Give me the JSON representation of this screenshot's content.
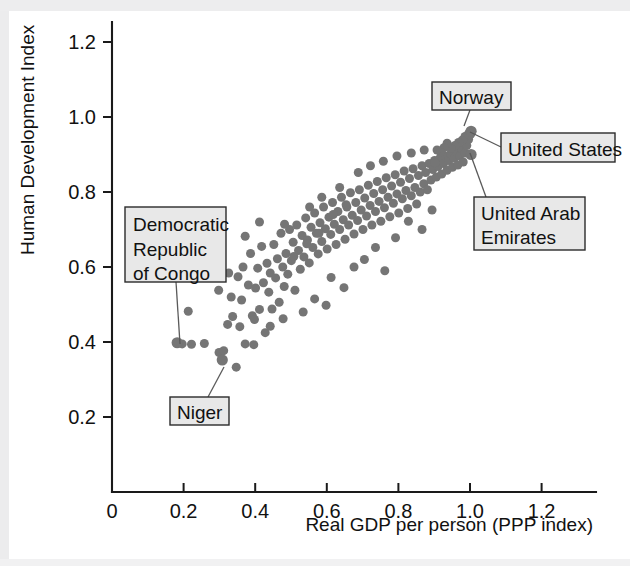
{
  "chart_data": {
    "type": "scatter",
    "title": "",
    "xlabel": "Real GDP per person (PPP index)",
    "ylabel": "Human Development Index",
    "xlim": [
      0,
      1.32
    ],
    "ylim": [
      0,
      1.3
    ],
    "grid": false,
    "legend": "none",
    "xticks": [
      "0",
      "0.2",
      "0.4",
      "0.6",
      "0.8",
      "1.0",
      "1.2"
    ],
    "xtick_values": [
      0,
      0.2,
      0.4,
      0.6,
      0.8,
      1.0,
      1.2
    ],
    "yticks": [
      "0.2",
      "0.4",
      "0.6",
      "0.8",
      "1.0",
      "1.2"
    ],
    "ytick_values": [
      0.2,
      0.4,
      0.6,
      0.8,
      1.0,
      1.2
    ],
    "marker_color": "#757575",
    "marker_size": 9,
    "points": [
      [
        0.182,
        0.398
      ],
      [
        0.196,
        0.395
      ],
      [
        0.213,
        0.482
      ],
      [
        0.222,
        0.394
      ],
      [
        0.258,
        0.396
      ],
      [
        0.299,
        0.372
      ],
      [
        0.308,
        0.352
      ],
      [
        0.312,
        0.377
      ],
      [
        0.323,
        0.447
      ],
      [
        0.333,
        0.52
      ],
      [
        0.337,
        0.468
      ],
      [
        0.347,
        0.333
      ],
      [
        0.352,
        0.574
      ],
      [
        0.357,
        0.441
      ],
      [
        0.362,
        0.512
      ],
      [
        0.366,
        0.6
      ],
      [
        0.372,
        0.395
      ],
      [
        0.381,
        0.552
      ],
      [
        0.387,
        0.636
      ],
      [
        0.392,
        0.47
      ],
      [
        0.396,
        0.393
      ],
      [
        0.401,
        0.544
      ],
      [
        0.407,
        0.597
      ],
      [
        0.412,
        0.487
      ],
      [
        0.418,
        0.655
      ],
      [
        0.423,
        0.558
      ],
      [
        0.428,
        0.425
      ],
      [
        0.433,
        0.61
      ],
      [
        0.438,
        0.533
      ],
      [
        0.442,
        0.584
      ],
      [
        0.447,
        0.488
      ],
      [
        0.452,
        0.66
      ],
      [
        0.457,
        0.571
      ],
      [
        0.462,
        0.622
      ],
      [
        0.467,
        0.506
      ],
      [
        0.472,
        0.69
      ],
      [
        0.477,
        0.6
      ],
      [
        0.481,
        0.548
      ],
      [
        0.486,
        0.636
      ],
      [
        0.491,
        0.581
      ],
      [
        0.496,
        0.7
      ],
      [
        0.501,
        0.617
      ],
      [
        0.506,
        0.666
      ],
      [
        0.511,
        0.538
      ],
      [
        0.516,
        0.712
      ],
      [
        0.521,
        0.644
      ],
      [
        0.526,
        0.594
      ],
      [
        0.531,
        0.684
      ],
      [
        0.536,
        0.627
      ],
      [
        0.541,
        0.731
      ],
      [
        0.546,
        0.672
      ],
      [
        0.551,
        0.611
      ],
      [
        0.556,
        0.706
      ],
      [
        0.561,
        0.652
      ],
      [
        0.566,
        0.744
      ],
      [
        0.571,
        0.69
      ],
      [
        0.576,
        0.635
      ],
      [
        0.581,
        0.718
      ],
      [
        0.586,
        0.668
      ],
      [
        0.591,
        0.76
      ],
      [
        0.596,
        0.702
      ],
      [
        0.601,
        0.648
      ],
      [
        0.606,
        0.733
      ],
      [
        0.611,
        0.687
      ],
      [
        0.616,
        0.772
      ],
      [
        0.621,
        0.714
      ],
      [
        0.626,
        0.66
      ],
      [
        0.631,
        0.748
      ],
      [
        0.636,
        0.7
      ],
      [
        0.641,
        0.786
      ],
      [
        0.646,
        0.726
      ],
      [
        0.651,
        0.674
      ],
      [
        0.656,
        0.76
      ],
      [
        0.661,
        0.712
      ],
      [
        0.666,
        0.798
      ],
      [
        0.671,
        0.738
      ],
      [
        0.676,
        0.688
      ],
      [
        0.681,
        0.772
      ],
      [
        0.686,
        0.724
      ],
      [
        0.691,
        0.806
      ],
      [
        0.696,
        0.752
      ],
      [
        0.701,
        0.7
      ],
      [
        0.706,
        0.784
      ],
      [
        0.711,
        0.736
      ],
      [
        0.716,
        0.818
      ],
      [
        0.721,
        0.764
      ],
      [
        0.726,
        0.712
      ],
      [
        0.731,
        0.796
      ],
      [
        0.736,
        0.748
      ],
      [
        0.741,
        0.828
      ],
      [
        0.746,
        0.775
      ],
      [
        0.751,
        0.722
      ],
      [
        0.756,
        0.806
      ],
      [
        0.761,
        0.758
      ],
      [
        0.766,
        0.838
      ],
      [
        0.771,
        0.786
      ],
      [
        0.776,
        0.734
      ],
      [
        0.781,
        0.816
      ],
      [
        0.786,
        0.77
      ],
      [
        0.791,
        0.846
      ],
      [
        0.796,
        0.795
      ],
      [
        0.801,
        0.744
      ],
      [
        0.806,
        0.826
      ],
      [
        0.811,
        0.782
      ],
      [
        0.816,
        0.856
      ],
      [
        0.821,
        0.804
      ],
      [
        0.826,
        0.756
      ],
      [
        0.831,
        0.836
      ],
      [
        0.836,
        0.79
      ],
      [
        0.841,
        0.862
      ],
      [
        0.846,
        0.812
      ],
      [
        0.851,
        0.768
      ],
      [
        0.856,
        0.844
      ],
      [
        0.861,
        0.8
      ],
      [
        0.866,
        0.87
      ],
      [
        0.871,
        0.822
      ],
      [
        0.876,
        0.852
      ],
      [
        0.881,
        0.806
      ],
      [
        0.886,
        0.876
      ],
      [
        0.891,
        0.832
      ],
      [
        0.896,
        0.86
      ],
      [
        0.901,
        0.884
      ],
      [
        0.906,
        0.84
      ],
      [
        0.911,
        0.868
      ],
      [
        0.916,
        0.89
      ],
      [
        0.921,
        0.848
      ],
      [
        0.926,
        0.876
      ],
      [
        0.931,
        0.896
      ],
      [
        0.936,
        0.858
      ],
      [
        0.941,
        0.884
      ],
      [
        0.946,
        0.902
      ],
      [
        0.951,
        0.866
      ],
      [
        0.956,
        0.89
      ],
      [
        0.961,
        0.908
      ],
      [
        0.966,
        0.872
      ],
      [
        0.971,
        0.896
      ],
      [
        0.976,
        0.916
      ],
      [
        0.981,
        0.88
      ],
      [
        0.986,
        0.904
      ],
      [
        0.991,
        0.924
      ],
      [
        0.996,
        0.94
      ],
      [
        0.999,
        0.955
      ],
      [
        1.003,
        0.962
      ],
      [
        0.986,
        0.948
      ],
      [
        0.978,
        0.938
      ],
      [
        0.968,
        0.932
      ],
      [
        0.958,
        0.924
      ],
      [
        0.947,
        0.916
      ],
      [
        0.936,
        0.93
      ],
      [
        0.927,
        0.918
      ],
      [
        0.918,
        0.906
      ],
      [
        0.908,
        0.912
      ],
      [
        0.612,
        0.572
      ],
      [
        0.648,
        0.545
      ],
      [
        0.676,
        0.6
      ],
      [
        0.705,
        0.62
      ],
      [
        0.736,
        0.652
      ],
      [
        0.762,
        0.59
      ],
      [
        0.792,
        0.678
      ],
      [
        0.828,
        0.722
      ],
      [
        0.866,
        0.7
      ],
      [
        0.894,
        0.752
      ],
      [
        0.566,
        0.515
      ],
      [
        0.534,
        0.48
      ],
      [
        0.598,
        0.498
      ],
      [
        0.478,
        0.462
      ],
      [
        0.442,
        0.442
      ],
      [
        0.398,
        0.46
      ],
      [
        0.508,
        0.628
      ],
      [
        0.552,
        0.76
      ],
      [
        0.586,
        0.786
      ],
      [
        0.482,
        0.714
      ],
      [
        0.636,
        0.812
      ],
      [
        0.688,
        0.852
      ],
      [
        0.722,
        0.87
      ],
      [
        0.758,
        0.882
      ],
      [
        0.796,
        0.896
      ],
      [
        0.836,
        0.904
      ],
      [
        0.872,
        0.912
      ],
      [
        0.902,
        0.878
      ],
      [
        0.618,
        0.74
      ],
      [
        0.654,
        0.766
      ],
      [
        0.578,
        0.69
      ],
      [
        0.544,
        0.662
      ],
      [
        0.326,
        0.584
      ],
      [
        0.298,
        0.538
      ],
      [
        0.372,
        0.682
      ],
      [
        0.412,
        0.72
      ]
    ],
    "annotations": [
      {
        "label": "Democratic\nRepublic\nof Congo",
        "point": [
          0.182,
          0.398
        ],
        "box_px": {
          "x": 125,
          "y": 207,
          "w": 101,
          "h": 75
        },
        "leader_px": [
          [
            176,
            282
          ],
          [
            180,
            344
          ]
        ]
      },
      {
        "label": "Niger",
        "point": [
          0.308,
          0.352
        ],
        "box_px": {
          "x": 170,
          "y": 397,
          "w": 59,
          "h": 28
        },
        "leader_px": [
          [
            208,
            397
          ],
          [
            224,
            367
          ]
        ]
      },
      {
        "label": "Norway",
        "point": [
          0.999,
          0.955
        ],
        "box_px": {
          "x": 432,
          "y": 82,
          "w": 79,
          "h": 28
        },
        "leader_px": [
          [
            470,
            110
          ],
          [
            464,
            126
          ]
        ]
      },
      {
        "label": "United States",
        "point": [
          1.003,
          0.962
        ],
        "box_px": {
          "x": 501,
          "y": 133,
          "w": 114,
          "h": 29
        },
        "leader_px": [
          [
            501,
            147
          ],
          [
            470,
            132
          ]
        ]
      },
      {
        "label": "United Arab\nEmirates",
        "point": [
          1.003,
          0.9
        ],
        "box_px": {
          "x": 474,
          "y": 197,
          "w": 111,
          "h": 53
        },
        "leader_px": [
          [
            486,
            197
          ],
          [
            470,
            153
          ]
        ]
      }
    ]
  },
  "axes": {
    "y_title": "Human Development Index",
    "x_title": "Real GDP per person (PPP index)",
    "x_tick_labels": [
      "0",
      "0.2",
      "0.4",
      "0.6",
      "0.8",
      "1.0",
      "1.2"
    ],
    "y_tick_labels": [
      "1.2",
      "1.0",
      "0.8",
      "0.6",
      "0.4",
      "0.2"
    ]
  },
  "callouts": {
    "drc_line1": "Democratic",
    "drc_line2": "Republic",
    "drc_line3": "of Congo",
    "niger": "Niger",
    "norway": "Norway",
    "united_states": "United States",
    "uae_line1": "United Arab",
    "uae_line2": "Emirates"
  },
  "colors": {
    "marker": "#757575",
    "axis": "#1a1a1a",
    "callout_fill": "#e8e8e8",
    "callout_stroke": "#2b2b2b",
    "background": "#ffffff"
  }
}
